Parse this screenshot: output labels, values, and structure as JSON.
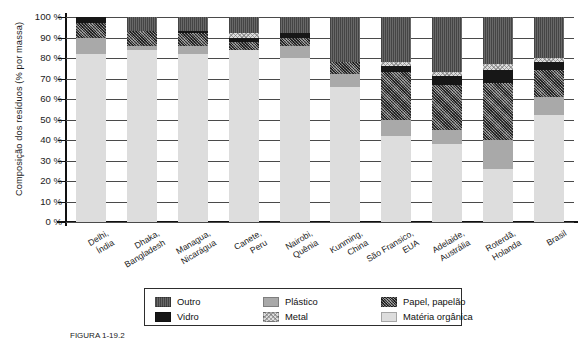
{
  "chart_data": {
    "type": "bar",
    "subtype": "stacked-100-percent",
    "title": "",
    "xlabel": "",
    "ylabel": "Composição dos resíduos (% por massa)",
    "ylim": [
      0,
      100
    ],
    "ytick_labels": [
      "100 %",
      "90 %",
      "80 %",
      "70 %",
      "60 %",
      "50 %",
      "40 %",
      "30 %",
      "20 %",
      "10 %",
      "0 %"
    ],
    "ytick_values": [
      100,
      90,
      80,
      70,
      60,
      50,
      40,
      30,
      20,
      10,
      0
    ],
    "grid": true,
    "legend_position": "bottom",
    "categories": [
      "Delhi,\nÍndia",
      "Dhaka,\nBangladesh",
      "Managua,\nNicarágua",
      "Canete,\nPeru",
      "Nairobi,\nQuênia",
      "Kunming,\nChina",
      "São Fransico,\nEUA",
      "Adelaide,\nAustrália",
      "Roterdã,\nHolanda",
      "Brasil"
    ],
    "category_labels": [
      [
        "Delhi,",
        "Índia"
      ],
      [
        "Dhaka,",
        "Bangladesh"
      ],
      [
        "Managua,",
        "Nicarágua"
      ],
      [
        "Canete,",
        "Peru"
      ],
      [
        "Nairobi,",
        "Quênia"
      ],
      [
        "Kunming,",
        "China"
      ],
      [
        "São Fransico,",
        "EUA"
      ],
      [
        "Adelaide,",
        "Austrália"
      ],
      [
        "Roterdã,",
        "Holanda"
      ],
      [
        "Brasil"
      ]
    ],
    "series": [
      {
        "name": "Matéria orgânica",
        "key": "organica",
        "color": "#dddddd",
        "values": [
          82,
          84,
          82,
          84,
          80,
          66,
          42,
          38,
          26,
          52
        ]
      },
      {
        "name": "Plástico",
        "key": "plastico",
        "color": "#a9a9a9",
        "values": [
          8,
          2,
          4,
          0,
          6,
          6,
          8,
          7,
          14,
          9
        ]
      },
      {
        "name": "Papel, papelão",
        "key": "papel",
        "color": "#5e5e5e",
        "values": [
          7,
          7,
          6,
          4,
          4,
          6,
          23,
          22,
          28,
          13
        ]
      },
      {
        "name": "Vidro",
        "key": "vidro",
        "color": "#171717",
        "values": [
          3,
          0,
          1,
          2,
          2,
          0,
          3,
          4,
          6,
          4
        ]
      },
      {
        "name": "Metal",
        "key": "metal",
        "color": "#dedede",
        "values": [
          0,
          0,
          0,
          2,
          0,
          0,
          2,
          2,
          3,
          2
        ]
      },
      {
        "name": "Outro",
        "key": "outro",
        "color": "#575757",
        "values": [
          0,
          7,
          7,
          8,
          8,
          22,
          22,
          27,
          23,
          20
        ]
      }
    ],
    "stack_order": [
      "organica",
      "plastico",
      "papel",
      "vidro",
      "metal",
      "outro"
    ]
  },
  "legend": {
    "items": [
      {
        "label": "Outro",
        "key": "outro",
        "color": "#575757"
      },
      {
        "label": "Vidro",
        "key": "vidro",
        "color": "#171717"
      },
      {
        "label": "Plástico",
        "key": "plastico",
        "color": "#a9a9a9"
      },
      {
        "label": "Metal",
        "key": "metal",
        "color": "#dedede"
      },
      {
        "label": "Papel, papelão",
        "key": "papel",
        "color": "#5e5e5e"
      },
      {
        "label": "Matéria orgânica",
        "key": "organica",
        "color": "#dddddd"
      }
    ]
  },
  "caption": "FIGURA 1-19.2"
}
